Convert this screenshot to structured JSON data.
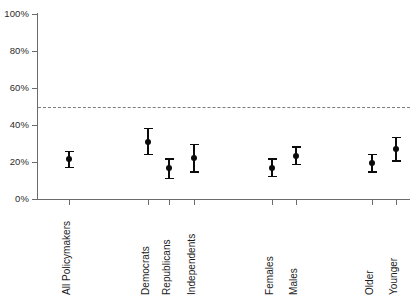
{
  "chart_data": {
    "type": "scatter",
    "title": "",
    "subtitle": "",
    "xlabel": "",
    "ylabel": "",
    "ylim": [
      0,
      100
    ],
    "yticks": [
      0,
      20,
      40,
      60,
      80,
      100
    ],
    "ytick_labels": [
      "0%",
      "20%",
      "40%",
      "60%",
      "80%",
      "100%"
    ],
    "grid": false,
    "legend": null,
    "reference_line": {
      "value": 50,
      "style": "dashed",
      "color": "#7d7d7d",
      "label": ""
    },
    "marker": "filled-circle-with-error-bars",
    "error_bar_type": "confidence-interval",
    "categories": [
      "All Policymakers",
      "Democrats",
      "Republicans",
      "Independents",
      "Females",
      "Males",
      "Older",
      "Younger"
    ],
    "points": [
      {
        "category": "All Policymakers",
        "x_px": 69,
        "value": 21.5,
        "ci_low": 17.5,
        "ci_high": 26.0,
        "group": "overall"
      },
      {
        "category": "Democrats",
        "x_px": 148,
        "value": 31.0,
        "ci_low": 24.5,
        "ci_high": 38.5,
        "group": "party"
      },
      {
        "category": "Republicans",
        "x_px": 169,
        "value": 16.5,
        "ci_low": 11.5,
        "ci_high": 22.0,
        "group": "party"
      },
      {
        "category": "Independents",
        "x_px": 194,
        "value": 22.0,
        "ci_low": 15.0,
        "ci_high": 30.0,
        "group": "party"
      },
      {
        "category": "Females",
        "x_px": 272,
        "value": 17.0,
        "ci_low": 12.5,
        "ci_high": 22.0,
        "group": "gender"
      },
      {
        "category": "Males",
        "x_px": 296,
        "value": 23.5,
        "ci_low": 19.0,
        "ci_high": 28.5,
        "group": "gender"
      },
      {
        "category": "Older",
        "x_px": 372,
        "value": 19.5,
        "ci_low": 15.0,
        "ci_high": 24.5,
        "group": "age"
      },
      {
        "category": "Younger",
        "x_px": 396,
        "value": 27.0,
        "ci_low": 21.0,
        "ci_high": 33.5,
        "group": "age"
      }
    ]
  },
  "axes": {
    "y": {
      "ticks": [
        {
          "label": "100%",
          "value": 100
        },
        {
          "label": "80%",
          "value": 80
        },
        {
          "label": "60%",
          "value": 60
        },
        {
          "label": "40%",
          "value": 40
        },
        {
          "label": "20%",
          "value": 20
        },
        {
          "label": "0%",
          "value": 0
        }
      ]
    },
    "x": {
      "ticks": [
        {
          "label": "All Policymakers",
          "x_px": 69
        },
        {
          "label": "Democrats",
          "x_px": 148
        },
        {
          "label": "Republicans",
          "x_px": 169
        },
        {
          "label": "Independents",
          "x_px": 194
        },
        {
          "label": "Females",
          "x_px": 272
        },
        {
          "label": "Males",
          "x_px": 296
        },
        {
          "label": "Older",
          "x_px": 372
        },
        {
          "label": "Younger",
          "x_px": 396
        }
      ]
    }
  },
  "colors": {
    "axis": "#6b6b6b",
    "marker": "#0b0b0b",
    "reference_line": "#7d7d7d",
    "background": "#ffffff",
    "tick_label": "#2b2b2b"
  }
}
